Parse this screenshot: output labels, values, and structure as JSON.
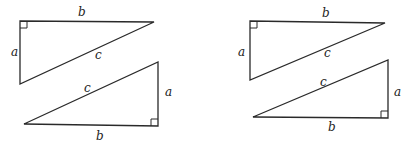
{
  "figures": [
    {
      "name": "left-pair",
      "top_triangle": {
        "vertices": [
          [
            20,
            21
          ],
          [
            154,
            22
          ],
          [
            20,
            84
          ]
        ],
        "right_angle_at": [
          20,
          21
        ],
        "labels": {
          "leg_vertical": {
            "text": "a",
            "x": 11,
            "y": 56
          },
          "leg_horizontal": {
            "text": "b",
            "x": 78,
            "y": 16
          },
          "hypotenuse": {
            "text": "c",
            "x": 95,
            "y": 59
          }
        }
      },
      "bottom_triangle": {
        "vertices": [
          [
            158,
            62
          ],
          [
            158,
            126
          ],
          [
            24,
            124
          ]
        ],
        "right_angle_at": [
          158,
          126
        ],
        "labels": {
          "leg_vertical": {
            "text": "a",
            "x": 165,
            "y": 96
          },
          "leg_horizontal": {
            "text": "b",
            "x": 96,
            "y": 140
          },
          "hypotenuse": {
            "text": "c",
            "x": 84,
            "y": 92
          }
        }
      }
    },
    {
      "name": "right-pair",
      "top_triangle": {
        "vertices": [
          [
            250,
            21
          ],
          [
            385,
            23
          ],
          [
            250,
            80
          ]
        ],
        "right_angle_at": [
          250,
          21
        ],
        "labels": {
          "leg_vertical": {
            "text": "a",
            "x": 238,
            "y": 56
          },
          "leg_horizontal": {
            "text": "b",
            "x": 322,
            "y": 17
          },
          "hypotenuse": {
            "text": "c",
            "x": 324,
            "y": 57
          }
        }
      },
      "bottom_triangle": {
        "vertices": [
          [
            388,
            60
          ],
          [
            388,
            118
          ],
          [
            253,
            117
          ]
        ],
        "right_angle_at": [
          388,
          118
        ],
        "labels": {
          "leg_vertical": {
            "text": "a",
            "x": 394,
            "y": 96
          },
          "leg_horizontal": {
            "text": "b",
            "x": 328,
            "y": 131
          },
          "hypotenuse": {
            "text": "c",
            "x": 320,
            "y": 86
          }
        }
      }
    }
  ]
}
